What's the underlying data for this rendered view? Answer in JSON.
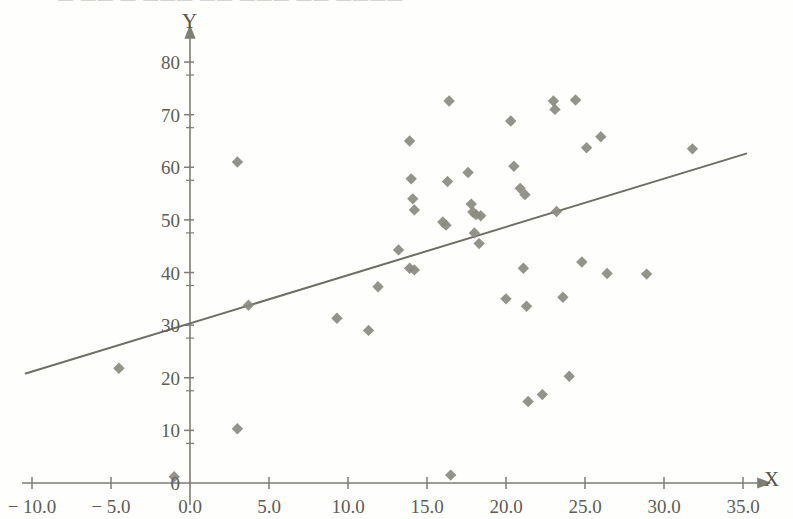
{
  "figure": {
    "width": 793,
    "height": 519,
    "background_color": "#fefefd",
    "cropped_header_text": "— —— — ——— —— ——— —— ————"
  },
  "axes": {
    "x_axis_title": "X",
    "y_axis_title": "Y",
    "x_tick_labels": [
      "− 10.0",
      "− 5.0",
      "0.0",
      "5.0",
      "10.0",
      "15.0",
      "20.0",
      "25.0",
      "30.0",
      "35.0"
    ],
    "x_tick_values": [
      -10,
      -5,
      0,
      5,
      10,
      15,
      20,
      25,
      30,
      35
    ],
    "y_tick_labels": [
      "0",
      "10",
      "20",
      "30",
      "40",
      "50",
      "60",
      "70",
      "80"
    ],
    "y_tick_values": [
      0,
      10,
      20,
      30,
      40,
      50,
      60,
      70,
      80
    ],
    "axis_color": "#7d7d74",
    "tick_text_color": "#5d5d55"
  },
  "chart_data": {
    "type": "scatter",
    "title": "",
    "xlabel": "X",
    "ylabel": "Y",
    "xlim": [
      -11.5,
      36.5
    ],
    "ylim": [
      -1.5,
      84
    ],
    "grid": false,
    "legend": null,
    "marker": {
      "shape": "diamond",
      "color": "#8a8a82",
      "size": 9
    },
    "points": [
      {
        "x": -4.5,
        "y": 21.8
      },
      {
        "x": 3.0,
        "y": 61.0
      },
      {
        "x": 3.0,
        "y": 10.3
      },
      {
        "x": 3.7,
        "y": 33.8
      },
      {
        "x": -1.0,
        "y": 1.2
      },
      {
        "x": 9.3,
        "y": 31.3
      },
      {
        "x": 11.3,
        "y": 29.0
      },
      {
        "x": 11.9,
        "y": 37.3
      },
      {
        "x": 13.2,
        "y": 44.3
      },
      {
        "x": 13.9,
        "y": 65.0
      },
      {
        "x": 14.0,
        "y": 57.8
      },
      {
        "x": 14.1,
        "y": 54.0
      },
      {
        "x": 14.2,
        "y": 51.9
      },
      {
        "x": 14.2,
        "y": 40.5
      },
      {
        "x": 13.9,
        "y": 40.8
      },
      {
        "x": 16.0,
        "y": 49.6
      },
      {
        "x": 16.2,
        "y": 49.0
      },
      {
        "x": 16.4,
        "y": 72.6
      },
      {
        "x": 16.3,
        "y": 57.3
      },
      {
        "x": 16.5,
        "y": 1.5
      },
      {
        "x": 17.6,
        "y": 59.0
      },
      {
        "x": 17.8,
        "y": 53.0
      },
      {
        "x": 17.9,
        "y": 51.5
      },
      {
        "x": 18.1,
        "y": 51.0
      },
      {
        "x": 18.4,
        "y": 50.8
      },
      {
        "x": 18.0,
        "y": 47.5
      },
      {
        "x": 18.3,
        "y": 45.5
      },
      {
        "x": 20.0,
        "y": 35.0
      },
      {
        "x": 20.3,
        "y": 68.8
      },
      {
        "x": 20.5,
        "y": 60.2
      },
      {
        "x": 20.9,
        "y": 56.0
      },
      {
        "x": 21.2,
        "y": 54.8
      },
      {
        "x": 21.1,
        "y": 40.8
      },
      {
        "x": 21.3,
        "y": 33.6
      },
      {
        "x": 21.4,
        "y": 15.5
      },
      {
        "x": 22.3,
        "y": 16.8
      },
      {
        "x": 23.0,
        "y": 72.6
      },
      {
        "x": 23.1,
        "y": 71.0
      },
      {
        "x": 23.2,
        "y": 51.6
      },
      {
        "x": 23.6,
        "y": 35.3
      },
      {
        "x": 24.0,
        "y": 20.3
      },
      {
        "x": 24.4,
        "y": 72.8
      },
      {
        "x": 24.8,
        "y": 42.0
      },
      {
        "x": 25.1,
        "y": 63.7
      },
      {
        "x": 26.0,
        "y": 65.8
      },
      {
        "x": 26.4,
        "y": 39.8
      },
      {
        "x": 28.9,
        "y": 39.7
      },
      {
        "x": 31.8,
        "y": 63.5
      }
    ],
    "trend_line": {
      "label": "regression-line",
      "color": "#6e6e66",
      "width": 2,
      "x_start": -10.4,
      "y_start": 20.8,
      "x_end": 35.2,
      "y_end": 62.6,
      "slope": 0.916,
      "intercept": 30.3
    }
  }
}
